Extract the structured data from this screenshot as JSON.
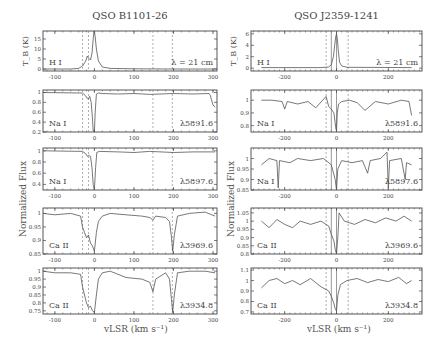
{
  "chart_data": [
    {
      "type": "line",
      "title": "QSO B1101-26",
      "column": "left",
      "xlabel": "v_LSR (km s^-1)",
      "ylabel": "Normalized Flux",
      "xlim": [
        -130,
        310
      ],
      "xticks": [
        -100,
        0,
        100,
        200,
        300
      ],
      "vlines_dashed": [
        -15,
        -30,
        148,
        197
      ],
      "panels": [
        {
          "species": "H I",
          "label": "λ = 21 cm",
          "ylabel": "T_B (K)",
          "ylim": [
            -1,
            19
          ],
          "yticks": [
            0,
            5,
            10,
            15
          ],
          "x": [
            -130,
            -60,
            -40,
            -30,
            -22,
            -18,
            -15,
            -10,
            -6,
            -3,
            -1,
            0,
            2,
            5,
            10,
            20,
            40,
            100,
            200,
            310
          ],
          "y": [
            0,
            0,
            0.3,
            1.5,
            4,
            6.5,
            5.5,
            4.5,
            8,
            15,
            19,
            19,
            16,
            10,
            4,
            1,
            0.3,
            0.1,
            0,
            0
          ]
        },
        {
          "species": "Na I",
          "label": "λ5891.6",
          "ylim": [
            0.2,
            1.05
          ],
          "yticks": [
            0.2,
            0.4,
            0.6,
            0.8,
            1
          ],
          "x": [
            -130,
            -30,
            -22,
            -18,
            -15,
            -12,
            -8,
            -5,
            -3,
            0,
            2,
            5,
            10,
            20,
            60,
            100,
            140,
            200,
            250,
            290,
            293,
            296,
            300,
            305
          ],
          "y": [
            1,
            0.99,
            0.93,
            0.88,
            0.87,
            0.92,
            0.8,
            0.5,
            0.22,
            0.2,
            0.6,
            0.97,
            0.99,
            0.98,
            0.97,
            0.98,
            0.96,
            0.98,
            0.97,
            0.98,
            0.94,
            0.85,
            0.75,
            0.7
          ]
        },
        {
          "species": "Na I",
          "label": "λ5897.6",
          "ylim": [
            0.3,
            1.05
          ],
          "yticks": [
            0.4,
            0.6,
            0.8,
            1
          ],
          "x": [
            -130,
            -30,
            -22,
            -18,
            -15,
            -10,
            -6,
            -3,
            0,
            3,
            6,
            12,
            60,
            100,
            140,
            200,
            250,
            305
          ],
          "y": [
            1,
            0.99,
            0.95,
            0.9,
            0.92,
            0.9,
            0.7,
            0.4,
            0.3,
            0.7,
            0.97,
            0.99,
            0.98,
            0.97,
            0.99,
            0.97,
            0.98,
            0.98
          ]
        },
        {
          "species": "Ca II",
          "label": "λ3969.6",
          "ylim": [
            0.85,
            1.02
          ],
          "yticks": [
            0.85,
            0.9,
            0.95,
            1
          ],
          "x": [
            -130,
            -100,
            -60,
            -35,
            -30,
            -25,
            -20,
            -15,
            -10,
            -5,
            0,
            5,
            10,
            20,
            40,
            80,
            120,
            140,
            148,
            155,
            180,
            190,
            195,
            198,
            202,
            210,
            240,
            280,
            305
          ],
          "y": [
            1.0,
            0.995,
            1.0,
            0.99,
            0.95,
            0.93,
            0.91,
            0.92,
            0.89,
            0.88,
            0.86,
            0.93,
            0.97,
            0.99,
            1.0,
            0.995,
            0.99,
            0.985,
            0.975,
            0.99,
            0.985,
            0.97,
            0.91,
            0.86,
            0.92,
            0.99,
            1.0,
            1.005,
            0.99
          ]
        },
        {
          "species": "Ca II",
          "label": "λ3934.8",
          "ylim": [
            0.73,
            1.02
          ],
          "yticks": [
            0.75,
            0.8,
            0.85,
            0.9,
            0.95,
            1
          ],
          "x": [
            -130,
            -100,
            -60,
            -35,
            -30,
            -25,
            -20,
            -15,
            -10,
            -5,
            0,
            5,
            10,
            20,
            40,
            80,
            120,
            140,
            148,
            155,
            180,
            190,
            195,
            198,
            202,
            210,
            240,
            280,
            305
          ],
          "y": [
            1.0,
            0.99,
            0.99,
            0.98,
            0.9,
            0.85,
            0.8,
            0.77,
            0.78,
            0.75,
            0.74,
            0.85,
            0.95,
            0.99,
            1.0,
            0.96,
            0.95,
            0.93,
            0.87,
            0.95,
            0.99,
            0.95,
            0.82,
            0.74,
            0.85,
            0.99,
            1.0,
            1.0,
            0.99
          ]
        }
      ]
    },
    {
      "type": "line",
      "title": "QSO J2359-1241",
      "column": "right",
      "xlabel": "v_LSR (km s^-1)",
      "ylabel": "Normalized Flux",
      "xlim": [
        -330,
        330
      ],
      "xticks": [
        -200,
        0,
        200
      ],
      "vlines_dashed": [
        -40,
        45
      ],
      "vlines_solid": [
        -20,
        0
      ],
      "panels": [
        {
          "species": "H I",
          "label": "λ = 21 cm",
          "ylabel": "T_B (K)",
          "ylim": [
            -0.5,
            6.5
          ],
          "yticks": [
            0,
            2,
            4,
            6
          ],
          "x": [
            -290,
            -60,
            -30,
            -20,
            -12,
            -7,
            -3,
            0,
            3,
            7,
            12,
            20,
            40,
            290
          ],
          "y": [
            0.1,
            0.1,
            0.2,
            0.6,
            2,
            4,
            5.5,
            6,
            5.2,
            3,
            1,
            0.4,
            0.15,
            0.1
          ]
        },
        {
          "species": "Na I",
          "label": "λ5891.6",
          "ylim": [
            0.75,
            1.08
          ],
          "yticks": [
            0.8,
            0.9,
            1
          ],
          "x": [
            -290,
            -250,
            -210,
            -200,
            -190,
            -150,
            -110,
            -80,
            -40,
            -30,
            -20,
            -10,
            -5,
            -2,
            0,
            3,
            8,
            20,
            50,
            80,
            110,
            150,
            200,
            250,
            280,
            290
          ],
          "y": [
            1.0,
            1.0,
            0.99,
            0.93,
            0.99,
            0.97,
            0.99,
            0.94,
            1.03,
            0.95,
            0.93,
            0.9,
            0.82,
            0.77,
            0.76,
            0.9,
            0.97,
            0.99,
            1.0,
            0.98,
            0.92,
            0.99,
            0.97,
            1.0,
            0.99,
            0.88
          ]
        },
        {
          "species": "Na I",
          "label": "λ5897.6",
          "ylim": [
            0.85,
            1.05
          ],
          "yticks": [
            0.85,
            0.9,
            0.95,
            1
          ],
          "x": [
            -290,
            -260,
            -230,
            -225,
            -220,
            -180,
            -150,
            -100,
            -50,
            -20,
            -5,
            0,
            5,
            20,
            60,
            100,
            120,
            130,
            170,
            195,
            200,
            205,
            250,
            265,
            270,
            290
          ],
          "y": [
            0.97,
            1.0,
            0.99,
            0.86,
            0.99,
            0.98,
            1.0,
            0.99,
            1.0,
            0.97,
            0.9,
            0.85,
            0.95,
            0.99,
            0.98,
            0.99,
            0.93,
            0.99,
            1.0,
            1.03,
            0.86,
            0.99,
            1.0,
            0.9,
            0.98,
            0.97
          ]
        },
        {
          "species": "Ca II",
          "label": "λ3969.6",
          "ylim": [
            0.8,
            1.08
          ],
          "yticks": [
            0.8,
            0.85,
            0.9,
            0.95,
            1,
            1.05
          ],
          "x": [
            -290,
            -260,
            -230,
            -200,
            -170,
            -140,
            -100,
            -60,
            -30,
            -20,
            -10,
            -5,
            0,
            5,
            10,
            30,
            70,
            110,
            150,
            190,
            230,
            260,
            290
          ],
          "y": [
            1.0,
            0.96,
            1.01,
            0.98,
            0.96,
            1.0,
            0.98,
            1.0,
            0.97,
            0.92,
            0.88,
            0.83,
            0.8,
            0.9,
            1.05,
            1.0,
            0.98,
            1.01,
            0.99,
            1.02,
            1.0,
            1.03,
            1.0
          ]
        },
        {
          "species": "Ca II",
          "label": "λ3934.8",
          "ylim": [
            0.68,
            1.12
          ],
          "yticks": [
            0.7,
            0.8,
            0.9,
            1,
            1.1
          ],
          "x": [
            -290,
            -260,
            -230,
            -200,
            -170,
            -140,
            -100,
            -60,
            -30,
            -20,
            -10,
            -5,
            0,
            5,
            15,
            40,
            80,
            120,
            160,
            200,
            240,
            270,
            290
          ],
          "y": [
            0.93,
            1.0,
            1.02,
            0.97,
            1.0,
            0.96,
            1.02,
            0.94,
            0.9,
            0.85,
            0.78,
            0.73,
            0.71,
            0.86,
            0.96,
            1.0,
            1.02,
            0.98,
            1.01,
            0.99,
            1.03,
            0.97,
            1.0
          ]
        }
      ]
    }
  ],
  "figure": {
    "left_title": "QSO B1101-26",
    "right_title": "QSO J2359-1241",
    "ylabel": "Normalized Flux",
    "xlabel": "vLSR (km s⁻¹)",
    "hi_ylabel": "TB (K)"
  }
}
